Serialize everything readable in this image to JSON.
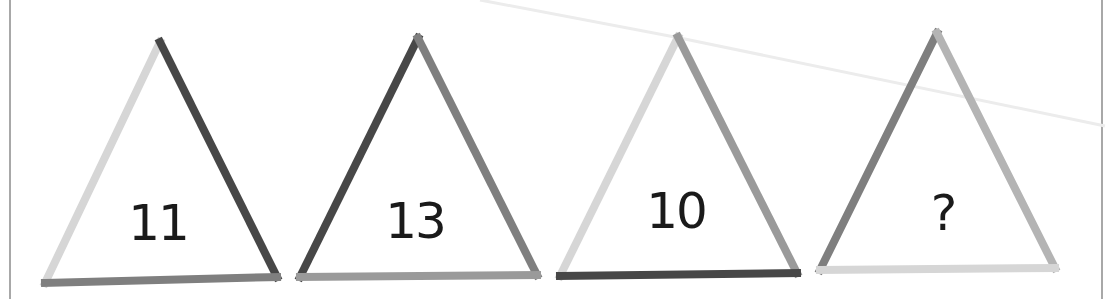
{
  "puzzle": {
    "colors": {
      "light": "#d6d6d6",
      "medium_light": "#b4b4b4",
      "medium": "#9a9a9a",
      "medium_dark": "#7f7f7f",
      "dark": "#474747",
      "border": "#a8a8a8",
      "faint_line": "#ececec"
    },
    "triangles": [
      {
        "label": "11",
        "apex": [
          160,
          42
        ],
        "bottom_left": [
          45,
          283
        ],
        "bottom_right": [
          277,
          277
        ],
        "edges": {
          "left": "light",
          "right": "dark",
          "bottom": "medium_dark"
        },
        "label_pos": [
          158,
          198
        ]
      },
      {
        "label": "13",
        "apex": [
          418,
          38
        ],
        "bottom_left": [
          300,
          277
        ],
        "bottom_right": [
          537,
          275
        ],
        "edges": {
          "left": "dark",
          "right": "medium_dark",
          "bottom": "medium"
        },
        "label_pos": [
          415,
          196
        ]
      },
      {
        "label": "10",
        "apex": [
          678,
          37
        ],
        "bottom_left": [
          560,
          276
        ],
        "bottom_right": [
          797,
          273
        ],
        "edges": {
          "left": "light",
          "right": "medium",
          "bottom": "dark"
        },
        "label_pos": [
          676,
          186
        ]
      },
      {
        "label": "?",
        "apex": [
          937,
          33
        ],
        "bottom_left": [
          820,
          270
        ],
        "bottom_right": [
          1055,
          268
        ],
        "edges": {
          "left": "medium_dark",
          "right": "medium_light",
          "bottom": "light"
        },
        "label_pos": [
          943,
          188
        ]
      }
    ]
  }
}
